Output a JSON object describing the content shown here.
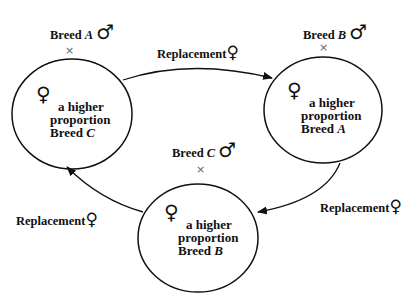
{
  "diagram": {
    "type": "rotational-crossbreeding-cycle",
    "nodes": [
      {
        "id": "herd-c",
        "line1": "a higher",
        "line2": "proportion",
        "line3_prefix": "Breed ",
        "line3_breed": "C",
        "female_symbol": "♀",
        "sire_label_prefix": "Breed ",
        "sire_breed": "A",
        "male_symbol": "♂",
        "cross_symbol": "×"
      },
      {
        "id": "herd-a",
        "line1": "a higher",
        "line2": "proportion",
        "line3_prefix": "Breed ",
        "line3_breed": "A",
        "female_symbol": "♀",
        "sire_label_prefix": "Breed ",
        "sire_breed": "B",
        "male_symbol": "♂",
        "cross_symbol": "×"
      },
      {
        "id": "herd-b",
        "line1": "a higher",
        "line2": "proportion",
        "line3_prefix": "Breed ",
        "line3_breed": "B",
        "female_symbol": "♀",
        "sire_label_prefix": "Breed ",
        "sire_breed": "C",
        "male_symbol": "♂",
        "cross_symbol": "×"
      }
    ],
    "edges": [
      {
        "from": "herd-c",
        "to": "herd-a",
        "label": "Replacement",
        "symbol": "♀"
      },
      {
        "from": "herd-a",
        "to": "herd-b",
        "label": "Replacement",
        "symbol": "♀"
      },
      {
        "from": "herd-b",
        "to": "herd-c",
        "label": "Replacement",
        "symbol": "♀"
      }
    ]
  }
}
